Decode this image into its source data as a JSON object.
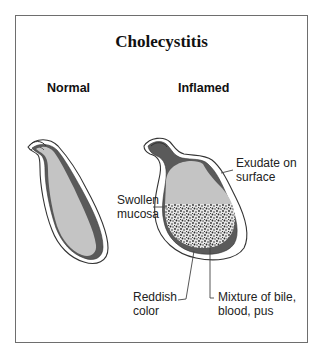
{
  "figure": {
    "title": "Cholecystitis",
    "panels": [
      {
        "label": "Normal"
      },
      {
        "label": "Inflamed"
      }
    ],
    "annotations": {
      "exudate": "Exudate on\nsurface",
      "swollen_mucosa": "Swollen\nmucosa",
      "reddish_color": "Reddish\ncolor",
      "mixture": "Mixture of bile,\nblood, pus"
    },
    "colors": {
      "frame": "#6e6e6e",
      "lumen": "#c4c4c4",
      "wall": "#5a5a5a",
      "outline": "#333333",
      "stipple": "#2a2a2a"
    }
  }
}
